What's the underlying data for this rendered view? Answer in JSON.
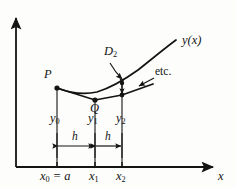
{
  "figure": {
    "type": "math-diagram",
    "background_color": "#fdfdfb",
    "ink_color": "#141414"
  },
  "axes": {
    "x_axis_label": "x",
    "y_axis_label": "",
    "x_axis_arrow": "arrow-right",
    "y_axis_arrow": "arrow-up",
    "origin_px": [
      16,
      167
    ]
  },
  "curve": {
    "name": "y(x)",
    "label": "y(x)",
    "label_pos_px": [
      182,
      41
    ],
    "points_px": [
      [
        57,
        88
      ],
      [
        70,
        92
      ],
      [
        84,
        94
      ],
      [
        97,
        93
      ],
      [
        110,
        89
      ],
      [
        122,
        83
      ],
      [
        136,
        74
      ],
      [
        150,
        63
      ],
      [
        163,
        51
      ],
      [
        175,
        41
      ]
    ]
  },
  "chord_polyline": {
    "name": "chord-path",
    "description": "straight-line segments P-Q-R approximating the curve",
    "points_px": [
      [
        57,
        88
      ],
      [
        95,
        100
      ],
      [
        122,
        95
      ],
      [
        152,
        84
      ]
    ]
  },
  "points": [
    {
      "id": "P",
      "label": "P",
      "marker_px": [
        57,
        88
      ],
      "label_pos_px": [
        44,
        74
      ]
    },
    {
      "id": "Q",
      "label": "Q",
      "marker_px": [
        95,
        100
      ],
      "label_pos_px": [
        90,
        106
      ]
    }
  ],
  "ordinates": [
    {
      "label": "y",
      "sub": "0",
      "x_px": 57,
      "top_px": 88,
      "bottom_px": 167,
      "label_pos_px": [
        50,
        118
      ]
    },
    {
      "label": "y",
      "sub": "1",
      "x_px": 95,
      "top_px": 100,
      "bottom_px": 167,
      "label_pos_px": [
        88,
        118
      ]
    },
    {
      "label": "y",
      "sub": "2",
      "x_px": 122,
      "top_px": 83,
      "bottom_px": 167,
      "label_pos_px": [
        116,
        118
      ]
    }
  ],
  "abscissa_ticks": [
    {
      "label": "x",
      "sub": "0",
      "suffix": "= a",
      "x_px": 57,
      "label_pos_px": [
        44,
        170
      ]
    },
    {
      "label": "x",
      "sub": "1",
      "suffix": "",
      "x_px": 95,
      "label_pos_px": [
        89,
        170
      ]
    },
    {
      "label": "x",
      "sub": "2",
      "suffix": "",
      "x_px": 122,
      "label_pos_px": [
        116,
        170
      ]
    }
  ],
  "step_dimensions": [
    {
      "label": "h",
      "from_px": 57,
      "to_px": 95,
      "y_px": 146,
      "label_pos_px": [
        72,
        138
      ]
    },
    {
      "label": "h",
      "from_px": 95,
      "to_px": 122,
      "y_px": 146,
      "label_pos_px": [
        105,
        138
      ]
    }
  ],
  "annotations": [
    {
      "id": "D2",
      "label": "D",
      "sub": "2",
      "label_pos_px": [
        105,
        52
      ],
      "leader_from_px": [
        112,
        62
      ],
      "leader_to_px": [
        124,
        79
      ],
      "gap_arrow": {
        "x_px": 122,
        "top_px": 83,
        "bottom_px": 95
      }
    },
    {
      "id": "etc",
      "label": "etc.",
      "label_pos_px": [
        155,
        72
      ],
      "leader_from_px": [
        154,
        78
      ],
      "leader_to_px": [
        139,
        86
      ]
    }
  ]
}
